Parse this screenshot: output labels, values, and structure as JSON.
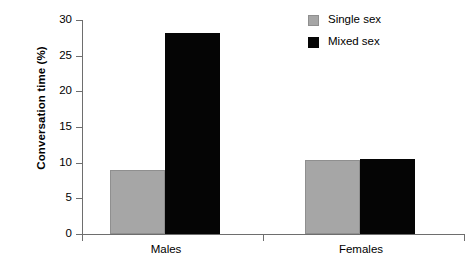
{
  "chart_data": {
    "type": "bar",
    "title": "",
    "subtitle": "",
    "xlabel": "",
    "ylabel": "Conversation time (%)",
    "categories": [
      "Males",
      "Females"
    ],
    "series": [
      {
        "name": "Single sex",
        "color": "#a6a6a6",
        "values": [
          9.0,
          10.4
        ]
      },
      {
        "name": "Mixed sex",
        "color": "#050505",
        "values": [
          28.2,
          10.5
        ]
      }
    ],
    "ylim": [
      0,
      30
    ],
    "ytick_labels": [
      "0",
      "5",
      "10",
      "15",
      "20",
      "25",
      "30"
    ],
    "ytick_values": [
      0,
      5,
      10,
      15,
      20,
      25,
      30
    ],
    "grid": false,
    "legend_position": "top-right"
  },
  "axes": {
    "y_title": "Conversation time (%)",
    "x_groups": [
      {
        "label": "Males"
      },
      {
        "label": "Females"
      }
    ]
  },
  "legend": {
    "entries": [
      {
        "label": "Single sex",
        "swatch": "single-sex-swatch"
      },
      {
        "label": "Mixed sex",
        "swatch": "mixed-sex-swatch"
      }
    ]
  }
}
